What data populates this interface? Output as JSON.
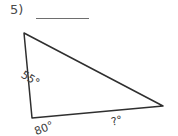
{
  "problem": {
    "number_label": "5)",
    "answer_blank_value": "",
    "answer_blank_placeholder": ""
  },
  "figure": {
    "shape_name": "triangle",
    "stroke_color": "#2f2f2f",
    "fill_color": "#ffffff",
    "vertices": {
      "top": {
        "x": 24,
        "y": 9
      },
      "bottom_left": {
        "x": 32,
        "y": 94
      },
      "right": {
        "x": 163,
        "y": 82
      }
    },
    "angles": [
      {
        "id": "top-angle",
        "label": "55°",
        "value": 55,
        "known": true
      },
      {
        "id": "bottom-left-angle",
        "label": "80°",
        "value": 80,
        "known": true
      },
      {
        "id": "right-angle",
        "label": "?°",
        "value": null,
        "known": false
      }
    ]
  }
}
